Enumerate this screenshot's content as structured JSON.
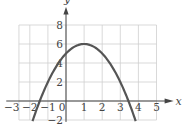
{
  "chart_data": {
    "type": "line",
    "title": "",
    "xlabel": "x",
    "ylabel": "y",
    "xlim": [
      -3,
      5
    ],
    "ylim": [
      -2,
      8
    ],
    "x_ticks": [
      -3,
      -2,
      -1,
      0,
      1,
      2,
      3,
      4,
      5
    ],
    "y_ticks": [
      -2,
      2,
      4,
      6,
      8
    ],
    "grid": true,
    "legend": null,
    "series": [
      {
        "name": "y = -(x - 1)^2 + 6",
        "vertex": [
          1,
          6
        ],
        "y_intercept": 5,
        "x_intercepts": [
          -1.45,
          3.45
        ],
        "x": [
          -1.85,
          -1.5,
          -1,
          -0.5,
          0,
          0.5,
          1,
          1.5,
          2,
          2.5,
          3,
          3.5,
          3.85
        ],
        "y": [
          -2.12,
          -0.25,
          2,
          3.75,
          5,
          5.75,
          6,
          5.75,
          5,
          3.75,
          2,
          -0.25,
          -2.12
        ]
      }
    ],
    "color": "#555555"
  },
  "labels": {
    "x_axis": "x",
    "y_axis": "y"
  }
}
